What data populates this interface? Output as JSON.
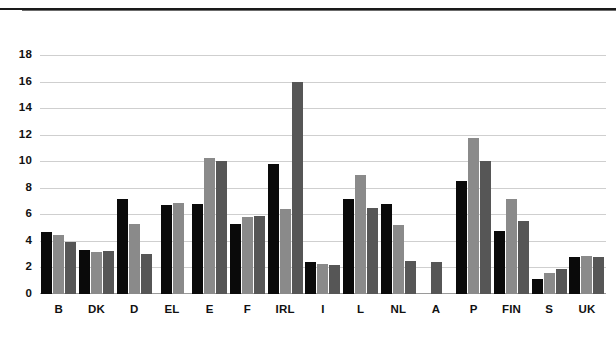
{
  "chart_data": {
    "type": "bar",
    "title": "",
    "subtitle": "",
    "xlabel": "",
    "ylabel": "",
    "ylim": [
      0,
      19
    ],
    "yticks": [
      0,
      2,
      4,
      6,
      8,
      10,
      12,
      14,
      16,
      18
    ],
    "grid": true,
    "legend": "none",
    "categories": [
      "B",
      "DK",
      "D",
      "EL",
      "E",
      "F",
      "IRL",
      "I",
      "L",
      "NL",
      "A",
      "P",
      "FIN",
      "S",
      "UK"
    ],
    "series": [
      {
        "name": "series-1",
        "color": "#0a0a0a",
        "values": [
          4.7,
          3.35,
          7.2,
          6.7,
          6.8,
          5.25,
          9.8,
          2.45,
          7.2,
          6.8,
          null,
          8.5,
          4.75,
          1.1,
          2.8
        ]
      },
      {
        "name": "series-2",
        "color": "#8a8a8a",
        "values": [
          4.45,
          3.15,
          5.3,
          6.85,
          10.25,
          5.8,
          6.4,
          2.3,
          9.0,
          5.2,
          null,
          11.8,
          7.15,
          1.6,
          2.9
        ]
      },
      {
        "name": "series-3",
        "color": "#565656",
        "values": [
          3.95,
          3.25,
          3.0,
          null,
          10.05,
          5.9,
          16.0,
          2.2,
          6.5,
          2.5,
          2.45,
          10.0,
          5.5,
          1.9,
          2.8
        ]
      }
    ]
  },
  "axis": {
    "y_tick_labels": [
      "18",
      "16",
      "14",
      "12",
      "10",
      "8",
      "6",
      "4",
      "2",
      "0"
    ],
    "x_tick_labels": [
      "B",
      "DK",
      "D",
      "EL",
      "E",
      "F",
      "IRL",
      "I",
      "L",
      "NL",
      "A",
      "P",
      "FIN",
      "S",
      "UK"
    ]
  }
}
